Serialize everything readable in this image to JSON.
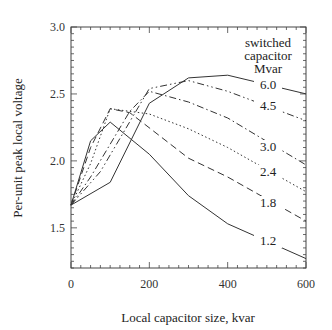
{
  "chart_data": {
    "type": "line",
    "title": "",
    "xlabel": "Local capacitor size, kvar",
    "ylabel": "Per-unit peak local voltage",
    "xlim": [
      0,
      600
    ],
    "ylim": [
      1.2,
      3.0
    ],
    "x_ticks": [
      0,
      200,
      400,
      600
    ],
    "x_tick_labels": [
      "0",
      "200",
      "400",
      "600"
    ],
    "y_ticks": [
      1.5,
      2.0,
      2.5,
      3.0
    ],
    "y_tick_labels": [
      "1.5",
      "2.0",
      "2.5",
      "3.0"
    ],
    "grid": false,
    "legend_title": [
      "switched",
      "capacitor",
      "Mvar"
    ],
    "series": [
      {
        "name": "6.0",
        "style": "solid",
        "x": [
          0,
          100,
          200,
          300,
          400,
          600
        ],
        "values": [
          1.67,
          1.84,
          2.43,
          2.62,
          2.64,
          2.5
        ]
      },
      {
        "name": "4.5",
        "style": "dashdotdot",
        "x": [
          0,
          75,
          200,
          300,
          400,
          600
        ],
        "values": [
          1.67,
          1.92,
          2.54,
          2.6,
          2.52,
          2.3
        ]
      },
      {
        "name": "3.0",
        "style": "dashdot",
        "x": [
          0,
          50,
          150,
          200,
          300,
          400,
          600
        ],
        "values": [
          1.67,
          1.88,
          2.37,
          2.52,
          2.44,
          2.32,
          1.97
        ]
      },
      {
        "name": "2.4",
        "style": "dotted",
        "x": [
          0,
          50,
          100,
          200,
          300,
          400,
          600
        ],
        "values": [
          1.67,
          1.98,
          2.39,
          2.35,
          2.24,
          2.1,
          1.77
        ]
      },
      {
        "name": "1.8",
        "style": "dashed",
        "x": [
          0,
          50,
          100,
          150,
          300,
          400,
          600
        ],
        "values": [
          1.67,
          2.1,
          2.39,
          2.36,
          2.02,
          1.88,
          1.55
        ]
      },
      {
        "name": "1.2",
        "style": "solid",
        "x": [
          0,
          50,
          100,
          200,
          300,
          400,
          600
        ],
        "values": [
          1.67,
          2.15,
          2.29,
          2.05,
          1.74,
          1.53,
          1.27
        ]
      }
    ]
  }
}
